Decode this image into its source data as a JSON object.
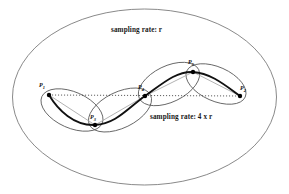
{
  "figure": {
    "width": 289,
    "height": 194,
    "background_color": "#ffffff"
  },
  "annotations": {
    "outer_label": "sampling rate: r",
    "inner_label": "sampling rate: 4 x r"
  },
  "points": [
    {
      "id": "P1",
      "name": "P",
      "subscript": "1",
      "x": 49,
      "y": 95,
      "label_x": 39,
      "label_y": 82
    },
    {
      "id": "P2",
      "name": "P",
      "subscript": "2",
      "x": 240,
      "y": 96,
      "label_x": 240,
      "label_y": 85
    },
    {
      "id": "P3",
      "name": "P",
      "subscript": "3",
      "x": 95,
      "y": 125,
      "label_x": 90,
      "label_y": 114
    },
    {
      "id": "P4",
      "name": "P",
      "subscript": "4",
      "x": 145,
      "y": 96,
      "label_x": 138,
      "label_y": 84
    },
    {
      "id": "P5",
      "name": "P",
      "subscript": "5",
      "x": 193,
      "y": 72,
      "label_x": 188,
      "label_y": 59
    }
  ],
  "outer_ellipse": {
    "cx": 144.5,
    "cy": 97,
    "rx": 132,
    "ry": 88,
    "stroke": "#6b6b6b",
    "stroke_width": 0.8,
    "fill": "none"
  },
  "sub_ellipses": [
    {
      "id": "ellipse-p1-p3",
      "cx": 72,
      "cy": 110,
      "rx": 33,
      "ry": 18,
      "rotation": 24,
      "stroke": "#555555"
    },
    {
      "id": "ellipse-p3-p4",
      "cx": 120,
      "cy": 110,
      "rx": 34,
      "ry": 18,
      "rotation": -26,
      "stroke": "#555555"
    },
    {
      "id": "ellipse-p4-p5",
      "cx": 169,
      "cy": 84,
      "rx": 33,
      "ry": 18,
      "rotation": -26,
      "stroke": "#555555"
    },
    {
      "id": "ellipse-p5-p2",
      "cx": 216,
      "cy": 84,
      "rx": 32,
      "ry": 17,
      "rotation": 24,
      "stroke": "#555555"
    }
  ],
  "chord_lines": {
    "style": "dotted",
    "stroke": "#333333",
    "segments": [
      {
        "id": "chord-p1-p2",
        "x1": 49,
        "y1": 95,
        "x2": 240,
        "y2": 96
      }
    ]
  },
  "connector_lines": {
    "style": "solid-gray",
    "stroke": "#a9a9a9",
    "segments": [
      {
        "id": "connector-p1-p3",
        "x1": 49,
        "y1": 95,
        "x2": 95,
        "y2": 125
      },
      {
        "id": "connector-p3-p4",
        "x1": 95,
        "y1": 125,
        "x2": 145,
        "y2": 96
      },
      {
        "id": "connector-p4-p5",
        "x1": 145,
        "y1": 96,
        "x2": 193,
        "y2": 72
      },
      {
        "id": "connector-p5-p2",
        "x1": 193,
        "y1": 72,
        "x2": 240,
        "y2": 96
      }
    ]
  },
  "trajectory": {
    "id": "sampled-curve",
    "stroke": "#111111",
    "stroke_width": 1.9,
    "description": "dark S-shaped curve through P1, P3, P4, P5, P2"
  },
  "dot_marker": {
    "radius": 2.2,
    "fill": "#000000"
  },
  "colors": {
    "outer_stroke": "#6b6b6b",
    "sub_stroke": "#555555",
    "curve": "#111111",
    "connector": "#a9a9a9",
    "chord": "#333333",
    "text": "#1a1a1a"
  }
}
